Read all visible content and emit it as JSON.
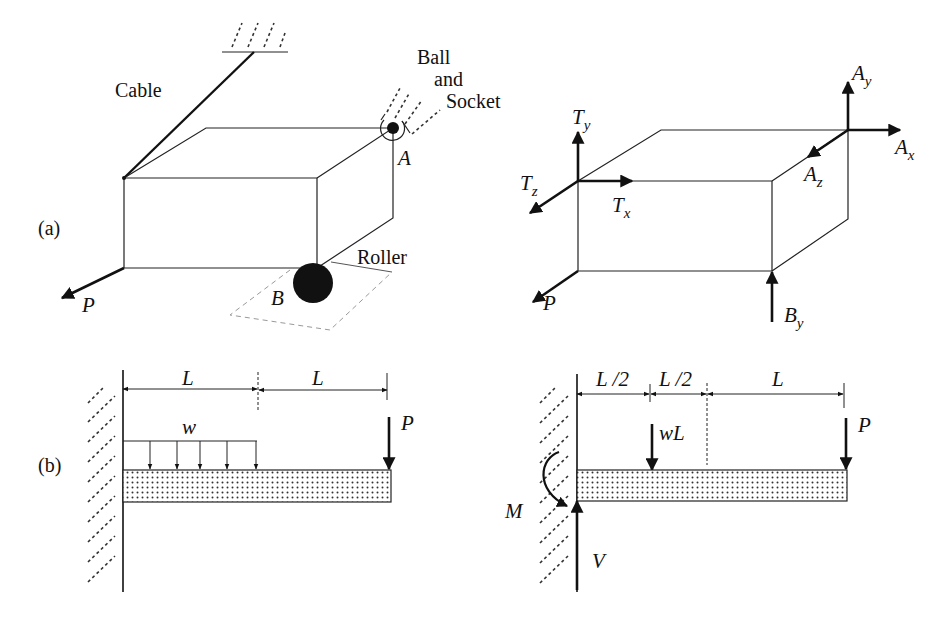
{
  "figure": {
    "panel_a_label": "(a)",
    "panel_b_label": "(b)"
  },
  "panel_a": {
    "left": {
      "cable_label": "Cable",
      "support_label_line1": "Ball",
      "support_label_line2": "and",
      "support_label_line3": "Socket",
      "point_a": "A",
      "point_b": "B",
      "roller_label": "Roller",
      "load": "P"
    },
    "right": {
      "forces": {
        "Ty": {
          "base": "T",
          "sub": "y"
        },
        "Tz": {
          "base": "T",
          "sub": "z"
        },
        "Tx": {
          "base": "T",
          "sub": "x"
        },
        "Ay": {
          "base": "A",
          "sub": "y"
        },
        "Ax": {
          "base": "A",
          "sub": "x"
        },
        "Az": {
          "base": "A",
          "sub": "z"
        },
        "By": {
          "base": "B",
          "sub": "y"
        },
        "P": {
          "base": "P",
          "sub": ""
        }
      }
    }
  },
  "panel_b": {
    "left": {
      "dim1": "L",
      "dim2": "L",
      "distributed_load": "w",
      "point_load": "P"
    },
    "right": {
      "dim1": "L /2",
      "dim2": "L /2",
      "dim3": "L",
      "resultant_load": "wL",
      "point_load": "P",
      "moment": "M",
      "shear": "V"
    }
  }
}
